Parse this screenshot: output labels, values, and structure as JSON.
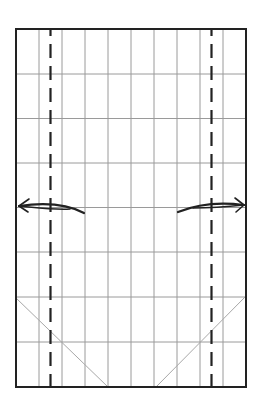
{
  "diagram": {
    "type": "origami-fold-diagram",
    "paper": {
      "x": 16,
      "y": 29,
      "width": 230,
      "height": 358
    },
    "grid": {
      "columns": [
        39,
        62,
        85,
        108,
        131,
        154,
        177,
        200,
        223
      ],
      "rows": [
        74,
        118.5,
        163,
        207.5,
        252,
        297,
        342
      ]
    },
    "fold_lines": [
      {
        "name": "left-valley-fold",
        "x": 50.5,
        "style": "dashed"
      },
      {
        "name": "right-valley-fold",
        "x": 211.5,
        "style": "dashed"
      }
    ],
    "creases": [
      {
        "name": "left-diagonal-crease",
        "x1": 16,
        "y1": 298,
        "x2": 108,
        "y2": 387
      },
      {
        "name": "right-diagonal-crease",
        "x1": 246,
        "y1": 296,
        "x2": 156,
        "y2": 387
      }
    ],
    "arrows": [
      {
        "name": "left-fold-arrow",
        "direction": "left"
      },
      {
        "name": "right-fold-arrow",
        "direction": "right"
      }
    ],
    "colors": {
      "edge": "#222222",
      "grid": "#999999",
      "fold": "#222222",
      "crease": "#aaaaaa",
      "arrow": "#222222"
    }
  }
}
